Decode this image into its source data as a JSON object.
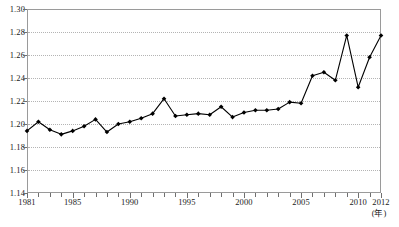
{
  "chart_data": {
    "type": "line",
    "title": "",
    "subtitle": "",
    "xlabel": "(年)",
    "ylabel": "",
    "xlim": [
      1981,
      2012
    ],
    "ylim": [
      1.14,
      1.3
    ],
    "ytick_step": 0.02,
    "grid": true,
    "legend": null,
    "marker": "diamond",
    "marker_color": "#000000",
    "line_color": "#000000",
    "x": [
      1981,
      1982,
      1983,
      1984,
      1985,
      1986,
      1987,
      1988,
      1989,
      1990,
      1991,
      1992,
      1993,
      1994,
      1995,
      1996,
      1997,
      1998,
      1999,
      2000,
      2001,
      2002,
      2003,
      2004,
      2005,
      2006,
      2007,
      2008,
      2009,
      2010,
      2011,
      2012
    ],
    "values": [
      1.194,
      1.202,
      1.195,
      1.191,
      1.194,
      1.198,
      1.204,
      1.193,
      1.2,
      1.202,
      1.205,
      1.209,
      1.222,
      1.207,
      1.208,
      1.209,
      1.208,
      1.215,
      1.206,
      1.21,
      1.212,
      1.212,
      1.213,
      1.219,
      1.218,
      1.242,
      1.245,
      1.238,
      1.277,
      1.232,
      1.258,
      1.277
    ],
    "ytick_labels": [
      "1.30",
      "1.28",
      "1.26",
      "1.24",
      "1.22",
      "1.20",
      "1.18",
      "1.16",
      "1.14"
    ],
    "ytick_values": [
      1.3,
      1.28,
      1.26,
      1.24,
      1.22,
      1.2,
      1.18,
      1.16,
      1.14
    ],
    "xtick_labels": [
      {
        "value": 1981,
        "label": "1981"
      },
      {
        "value": 1985,
        "label": "1985"
      },
      {
        "value": 1990,
        "label": "1990"
      },
      {
        "value": 1995,
        "label": "1995"
      },
      {
        "value": 2000,
        "label": "2000"
      },
      {
        "value": 2005,
        "label": "2005"
      },
      {
        "value": 2010,
        "label": "2010"
      },
      {
        "value": 2012,
        "label": "2012"
      }
    ]
  }
}
